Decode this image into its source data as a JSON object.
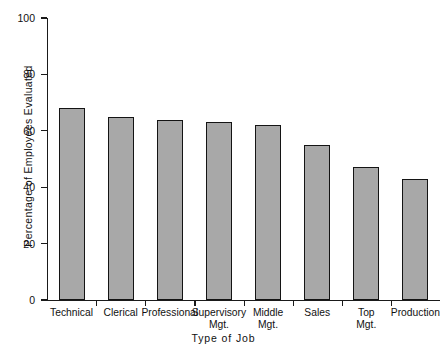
{
  "chart_data": {
    "type": "bar",
    "title": "",
    "xlabel": "Type of Job",
    "ylabel": "Percentage of Employees Evaluated",
    "ylim": [
      0,
      100
    ],
    "yticks": [
      0,
      20,
      40,
      60,
      80,
      100
    ],
    "ytick_labels": [
      "0",
      "20",
      "40",
      "60",
      "80",
      "100"
    ],
    "grid": false,
    "legend": "none",
    "categories": [
      "Technical",
      "Clerical",
      "Professional",
      "Supervisory\nMgt.",
      "Middle\nMgt.",
      "Sales",
      "Top\nMgt.",
      "Production"
    ],
    "values": [
      68,
      65,
      64,
      63,
      62,
      55,
      47,
      43
    ],
    "bar_fill_color": "#a8a8a8",
    "bar_edge_color": "#141414",
    "axis_color": "#1a1a1a",
    "background_color": "#ffffff"
  }
}
